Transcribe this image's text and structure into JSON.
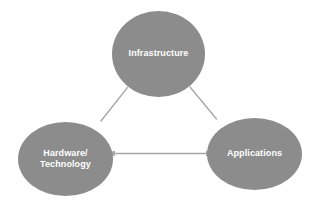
{
  "diagram": {
    "type": "triangle-relationship-diagram",
    "background_color": "#ffffff",
    "node_fill_color": "#8c8c8c",
    "node_text_color": "#ffffff",
    "connector_color": "#a6a6a6",
    "nodes": [
      {
        "id": "infrastructure",
        "label": "Infrastructure",
        "position": "top"
      },
      {
        "id": "hardware-technology",
        "label": "Hardware/\nTechnology",
        "position": "bottom-left"
      },
      {
        "id": "applications",
        "label": "Applications",
        "position": "bottom-right"
      }
    ],
    "connectors": [
      {
        "id": "infrastructure-to-hardware",
        "from": "infrastructure",
        "to": "hardware-technology",
        "style": "line",
        "arrows": "none"
      },
      {
        "id": "infrastructure-to-applications",
        "from": "infrastructure",
        "to": "applications",
        "style": "line",
        "arrows": "none"
      },
      {
        "id": "hardware-to-applications",
        "from": "hardware-technology",
        "to": "applications",
        "style": "line",
        "arrows": "both"
      }
    ]
  }
}
